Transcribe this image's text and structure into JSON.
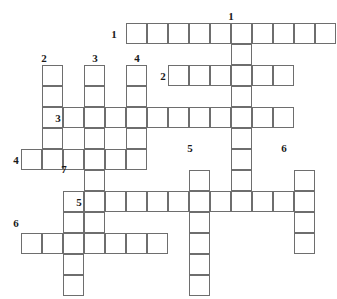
{
  "puzzle": {
    "type": "crossword-grid",
    "cell_size": 21,
    "origin_x": 21,
    "origin_y": 23,
    "grid_line_color": "#6e6e6e",
    "number_color": "#1a1a1a",
    "background": "#ffffff",
    "across": [
      {
        "number": "1",
        "row": 0,
        "col": 5,
        "length": 10
      },
      {
        "number": "2",
        "row": 2,
        "col": 7,
        "length": 6
      },
      {
        "number": "3",
        "row": 4,
        "col": 2,
        "length": 11
      },
      {
        "number": "4",
        "row": 6,
        "col": 0,
        "length": 6
      },
      {
        "number": "5",
        "row": 8,
        "col": 3,
        "length": 11
      },
      {
        "number": "6",
        "row": 10,
        "col": 0,
        "length": 7
      }
    ],
    "down": [
      {
        "number": "1",
        "row": 0,
        "col": 10,
        "length": 9
      },
      {
        "number": "2",
        "row": 2,
        "col": 1,
        "length": 5
      },
      {
        "number": "3",
        "row": 2,
        "col": 3,
        "length": 9
      },
      {
        "number": "4",
        "row": 2,
        "col": 5,
        "length": 4
      },
      {
        "number": "5",
        "row": 7,
        "col": 8,
        "length": 6
      },
      {
        "number": "6",
        "row": 7,
        "col": 13,
        "length": 4
      },
      {
        "number": "7",
        "row": 8,
        "col": 2,
        "length": 5
      }
    ],
    "across_labels": [
      {
        "text": "1",
        "x": 107,
        "y": 29
      },
      {
        "text": "2",
        "x": 156,
        "y": 71
      },
      {
        "text": "3",
        "x": 51,
        "y": 113
      },
      {
        "text": "4",
        "x": 9,
        "y": 155
      },
      {
        "text": "5",
        "x": 72,
        "y": 197
      },
      {
        "text": "6",
        "x": 9,
        "y": 218
      }
    ],
    "down_labels": [
      {
        "text": "1",
        "x": 224,
        "y": 11
      },
      {
        "text": "2",
        "x": 37,
        "y": 53
      },
      {
        "text": "3",
        "x": 88,
        "y": 53
      },
      {
        "text": "4",
        "x": 130,
        "y": 53
      },
      {
        "text": "5",
        "x": 183,
        "y": 143
      },
      {
        "text": "6",
        "x": 277,
        "y": 143
      },
      {
        "text": "7",
        "x": 57,
        "y": 164
      }
    ]
  }
}
